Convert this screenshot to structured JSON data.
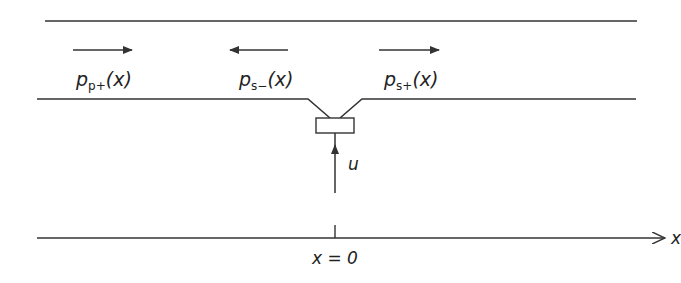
{
  "labels": {
    "p_plus_main": "p",
    "p_plus_sub": "p+",
    "p_plus_arg": "(x)",
    "s_minus_main": "p",
    "s_minus_sub": "s−",
    "s_minus_arg": "(x)",
    "s_plus_main": "p",
    "s_plus_sub": "s+",
    "s_plus_arg": "(x)",
    "u": "u",
    "x_axis": "x",
    "origin": "x = 0"
  },
  "colors": {
    "stroke": "#333333",
    "text": "#222222"
  }
}
